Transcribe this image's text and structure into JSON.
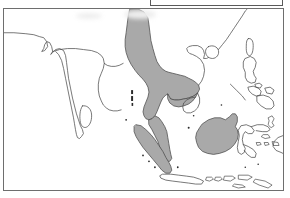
{
  "figure": {
    "kind": "distribution-range-map",
    "width_px": 290,
    "height_px": 198,
    "background_color": "#ffffff",
    "frame_color": "#6e6e6e",
    "caption_box_text": ""
  },
  "legend": {
    "box_label": "",
    "shaded_meaning": "",
    "unshaded_meaning": ""
  },
  "map": {
    "title": "",
    "region_name": "South and Southeast Asia",
    "colors": {
      "shaded_fill": "#a9a9a9",
      "unshaded_fill": "#ffffff",
      "coastline_stroke": "#4a4a4a",
      "island_dot": "#2b2b2b",
      "frame": "#6e6e6e"
    },
    "shaded_areas": [
      "Myanmar",
      "Thailand",
      "Laos",
      "Cambodia",
      "Malay Peninsula",
      "Sumatra",
      "Borneo"
    ],
    "unshaded_areas": [
      "India",
      "Sri Lanka",
      "Bangladesh",
      "Vietnam",
      "Hainan",
      "southern China",
      "Taiwan",
      "Philippines",
      "Java",
      "Sulawesi",
      "Lesser Sunda Islands",
      "New Guinea"
    ],
    "small_islands": [
      "Andaman Islands",
      "Nicobar Islands"
    ]
  },
  "artifacts": {
    "scan_smudges": [
      {
        "x": 80,
        "y": 12,
        "w": 26,
        "h": 6
      },
      {
        "x": 127,
        "y": 10,
        "w": 30,
        "h": 9
      }
    ]
  }
}
